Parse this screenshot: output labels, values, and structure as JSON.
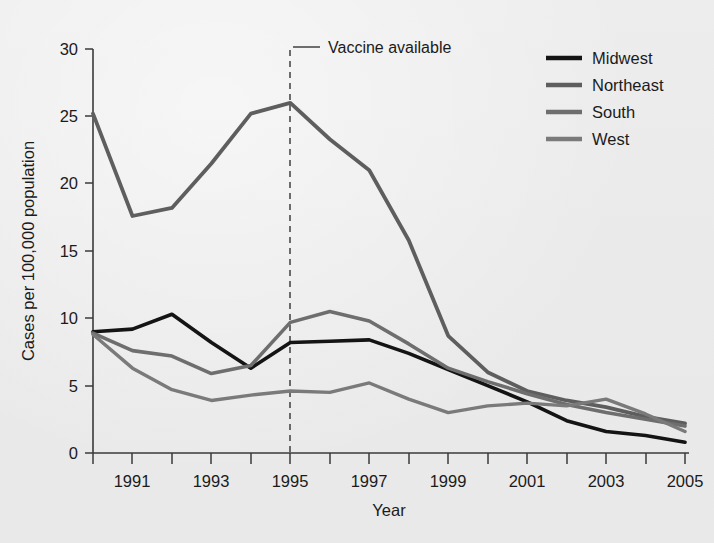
{
  "chart_data": {
    "type": "line",
    "title": "",
    "xlabel": "Year",
    "ylabel": "Cases per 100,000 population",
    "x": [
      1990,
      1991,
      1992,
      1993,
      1994,
      1995,
      1996,
      1997,
      1998,
      1999,
      2000,
      2001,
      2002,
      2003,
      2004,
      2005
    ],
    "xlim": [
      1990,
      2005
    ],
    "ylim": [
      0,
      30
    ],
    "yticks": [
      0,
      5,
      10,
      15,
      20,
      25,
      30
    ],
    "xticks": [
      1991,
      1993,
      1995,
      1997,
      1999,
      2001,
      2003,
      2005
    ],
    "xtick_labels": [
      "1991",
      "1993",
      "1995",
      "1997",
      "1999",
      "2001",
      "2003",
      "2005"
    ],
    "ytick_labels": [
      "0",
      "5",
      "10",
      "15",
      "20",
      "25",
      "30"
    ],
    "grid": false,
    "legend_position": "top-right",
    "series": [
      {
        "name": "Midwest",
        "color": "#141414",
        "values": [
          9.0,
          9.2,
          10.3,
          8.2,
          6.3,
          8.2,
          8.3,
          8.4,
          7.4,
          6.2,
          5.0,
          3.8,
          2.4,
          1.6,
          1.3,
          0.8
        ]
      },
      {
        "name": "Northeast",
        "color": "#5e5e5e",
        "values": [
          25.2,
          17.6,
          18.2,
          21.5,
          25.2,
          26.0,
          23.3,
          21.0,
          15.8,
          8.7,
          6.0,
          4.6,
          3.9,
          3.4,
          2.7,
          2.2
        ]
      },
      {
        "name": "South",
        "color": "#6e6e6e",
        "values": [
          8.9,
          7.6,
          7.2,
          5.9,
          6.5,
          9.7,
          10.5,
          9.8,
          8.1,
          6.3,
          5.3,
          4.4,
          3.6,
          3.0,
          2.5,
          2.0
        ]
      },
      {
        "name": "West",
        "color": "#7a7a7a",
        "values": [
          8.8,
          6.3,
          4.7,
          3.9,
          4.3,
          4.6,
          4.5,
          5.2,
          4.0,
          3.0,
          3.5,
          3.7,
          3.5,
          4.0,
          2.9,
          1.6
        ]
      }
    ],
    "annotations": [
      {
        "name": "vaccine-available",
        "label": "Vaccine available",
        "x": 1995,
        "type": "vertical-dashed-line"
      }
    ]
  },
  "legend": {
    "items": [
      {
        "label": "Midwest",
        "color": "#141414"
      },
      {
        "label": "Northeast",
        "color": "#5e5e5e"
      },
      {
        "label": "South",
        "color": "#6e6e6e"
      },
      {
        "label": "West",
        "color": "#7a7a7a"
      }
    ]
  },
  "axes": {
    "y_title": "Cases per 100,000 population",
    "x_title": "Year",
    "y_labels": [
      "30",
      "25",
      "20",
      "15",
      "10",
      "5",
      "0"
    ],
    "x_labels": [
      "1991",
      "1993",
      "1995",
      "1997",
      "1999",
      "2001",
      "2003",
      "2005"
    ]
  },
  "annotation": {
    "vaccine_label": "Vaccine available"
  }
}
